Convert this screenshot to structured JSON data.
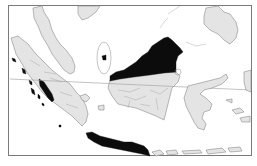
{
  "map": {
    "region": "Maritime Southeast Asia",
    "colors": {
      "background": "#ffffff",
      "land": "#e4e4e4",
      "highlight": "#0c0c0c",
      "outline": "#8a8a8a"
    },
    "highlighted_regions": [
      "north-borneo",
      "java",
      "sumatra-west-coast",
      "mentawai-islands",
      "natuna-island"
    ],
    "landmasses": [
      "malay-peninsula",
      "sumatra",
      "borneo",
      "java",
      "sulawesi",
      "philippines",
      "lesser-sunda-islands"
    ],
    "features": [
      "equator-line",
      "map-frame"
    ]
  }
}
